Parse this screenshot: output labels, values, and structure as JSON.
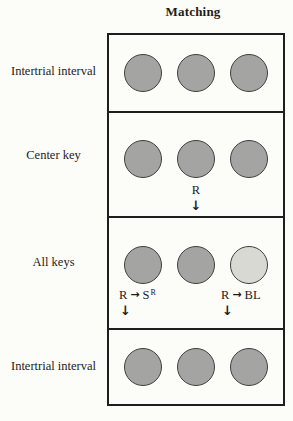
{
  "title": "Matching",
  "colors": {
    "background": "#fcfcf9",
    "text": "#1c1c1c",
    "border": "#1e1e1e",
    "key_fill": "#a4a4a2",
    "key_fill_light": "#d9d9d4",
    "key_stroke": "#3f3f3d"
  },
  "icons": {
    "down_arrow": "↓",
    "right_arrow": "→"
  },
  "rows": [
    {
      "label": "Intertrial interval",
      "keys": [
        "gray",
        "gray",
        "gray"
      ]
    },
    {
      "label": "Center key",
      "keys": [
        "gray",
        "gray",
        "gray"
      ],
      "annotation": {
        "response": "R"
      }
    },
    {
      "label": "All keys",
      "keys": [
        "gray",
        "gray",
        "light"
      ],
      "annotation_left": {
        "response": "R",
        "outcome": "S",
        "outcome_sup": "R"
      },
      "annotation_right": {
        "response": "R",
        "outcome": "BL"
      }
    },
    {
      "label": "Intertrial interval",
      "keys": [
        "gray",
        "gray",
        "gray"
      ]
    }
  ]
}
